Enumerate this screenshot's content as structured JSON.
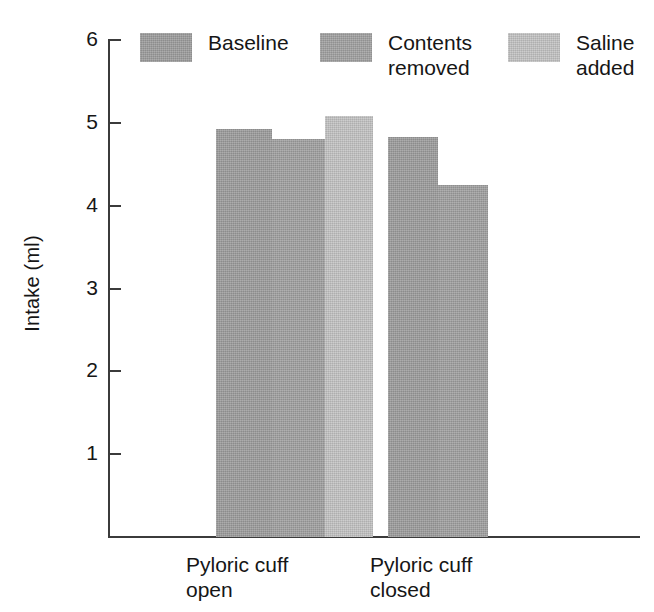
{
  "chart_data": {
    "type": "bar",
    "title": "",
    "xlabel": "",
    "ylabel": "Intake (ml)",
    "ylim": [
      0,
      6
    ],
    "yticks": [
      1,
      2,
      3,
      4,
      5,
      6
    ],
    "ytick_labels": [
      "1",
      "2",
      "3",
      "4",
      "5",
      "6"
    ],
    "grid": false,
    "legend_position": "top",
    "categories": [
      "Pyloric cuff\nopen",
      "Pyloric cuff\nclosed"
    ],
    "series": [
      {
        "name": "Baseline",
        "color": "#9a9a9a",
        "values": [
          4.93,
          4.83
        ]
      },
      {
        "name": "Contents\nremoved",
        "color": "#9e9e9e",
        "values": [
          4.8,
          4.25
        ]
      },
      {
        "name": "Saline\nadded",
        "color": "#bcbcbc",
        "values": [
          5.08,
          null
        ]
      }
    ],
    "bars": [
      {
        "group": "Pyloric cuff open",
        "series": "Baseline",
        "value": 4.93,
        "tone": "tone-dark",
        "left": 106,
        "width": 56
      },
      {
        "group": "Pyloric cuff open",
        "series": "Contents removed",
        "value": 4.8,
        "tone": "tone-mid",
        "left": 162,
        "width": 53
      },
      {
        "group": "Pyloric cuff open",
        "series": "Saline added",
        "value": 5.08,
        "tone": "tone-light",
        "left": 215,
        "width": 48
      },
      {
        "group": "Pyloric cuff closed",
        "series": "Baseline",
        "value": 4.83,
        "tone": "tone-dark",
        "left": 278,
        "width": 50
      },
      {
        "group": "Pyloric cuff closed",
        "series": "Contents removed",
        "value": 4.25,
        "tone": "tone-mid",
        "left": 328,
        "width": 50
      }
    ]
  },
  "axis": {
    "y_title": "Intake (ml)",
    "ticks": [
      {
        "label": "6",
        "value": 6
      },
      {
        "label": "5",
        "value": 5
      },
      {
        "label": "4",
        "value": 4
      },
      {
        "label": "3",
        "value": 3
      },
      {
        "label": "2",
        "value": 2
      },
      {
        "label": "1",
        "value": 1
      }
    ]
  },
  "legend": {
    "items": [
      {
        "label": "Baseline",
        "color": "#9a9a9a",
        "tone": "tone-dark",
        "left": 140
      },
      {
        "label": "Contents\nremoved",
        "color": "#9e9e9e",
        "tone": "tone-mid",
        "left": 320
      },
      {
        "label": "Saline\nadded",
        "color": "#bcbcbc",
        "tone": "tone-light",
        "left": 508
      }
    ]
  },
  "xlabels": [
    {
      "text": "Pyloric cuff\nopen",
      "pos": "first"
    },
    {
      "text": "Pyloric cuff\nclosed",
      "pos": "second"
    }
  ]
}
